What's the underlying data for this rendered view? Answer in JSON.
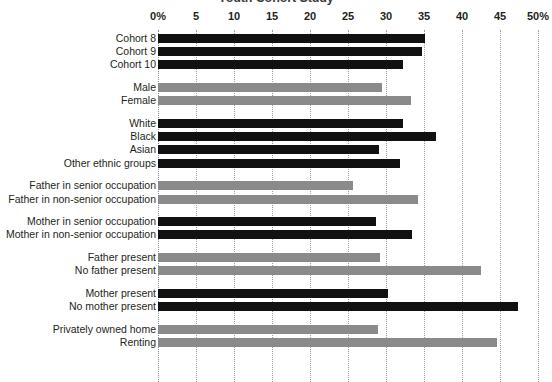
{
  "chart_data": {
    "type": "bar",
    "orientation": "horizontal",
    "title": "Youth Cohort Study",
    "xlabel": "",
    "ylabel": "",
    "xlim": [
      0,
      50
    ],
    "grid": true,
    "legend": "none",
    "xtick_labels": [
      "0%",
      "5",
      "10",
      "15",
      "20",
      "25",
      "30",
      "35",
      "40",
      "45",
      "50%"
    ],
    "xtick_values": [
      0,
      5,
      10,
      15,
      20,
      25,
      30,
      35,
      40,
      45,
      50
    ],
    "groups": [
      {
        "name": "cohort",
        "color": "#111111",
        "categories": [
          "Cohort 8",
          "Cohort 9",
          "Cohort 10"
        ],
        "values": [
          35.1,
          34.7,
          32.3
        ]
      },
      {
        "name": "sex",
        "color": "#8a8a8a",
        "categories": [
          "Male",
          "Female"
        ],
        "values": [
          29.5,
          33.3
        ]
      },
      {
        "name": "ethnicity",
        "color": "#111111",
        "categories": [
          "White",
          "Black",
          "Asian",
          "Other ethnic groups"
        ],
        "values": [
          32.2,
          36.6,
          29.1,
          31.8
        ]
      },
      {
        "name": "father-occupation",
        "color": "#8a8a8a",
        "categories": [
          "Father in senior occupation",
          "Father in non-senior occupation"
        ],
        "values": [
          25.6,
          34.2
        ]
      },
      {
        "name": "mother-occupation",
        "color": "#111111",
        "categories": [
          "Mother in senior occupation",
          "Mother in non-senior occupation"
        ],
        "values": [
          28.7,
          33.4
        ]
      },
      {
        "name": "father-presence",
        "color": "#8a8a8a",
        "categories": [
          "Father present",
          "No father present"
        ],
        "values": [
          29.2,
          42.5
        ]
      },
      {
        "name": "mother-presence",
        "color": "#111111",
        "categories": [
          "Mother present",
          "No mother present"
        ],
        "values": [
          30.3,
          47.4
        ]
      },
      {
        "name": "housing-tenure",
        "color": "#8a8a8a",
        "categories": [
          "Privately owned home",
          "Renting"
        ],
        "values": [
          29.0,
          44.6
        ]
      }
    ]
  },
  "colors": {
    "dark_bar": "#111111",
    "light_bar": "#8a8a8a",
    "gridline": "#9b9b9b",
    "text": "#231f20",
    "background": "#ffffff"
  }
}
